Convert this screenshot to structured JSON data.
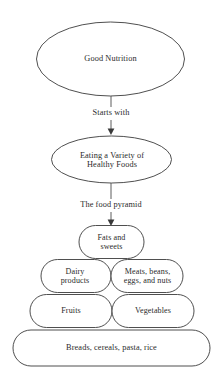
{
  "diagram": {
    "type": "flowchart",
    "title_node": "Good Nutrition",
    "nodes": [
      {
        "id": "good-nutrition",
        "shape": "ellipse",
        "label": "Good Nutrition"
      },
      {
        "id": "eating-variety",
        "shape": "ellipse",
        "label": "Eating a Variety of\nHealthy Foods"
      }
    ],
    "edges": [
      {
        "id": "edge-starts-with",
        "label": "Starts with",
        "from": "good-nutrition",
        "to": "eating-variety"
      },
      {
        "id": "edge-food-pyramid",
        "label": "The food pyramid",
        "from": "eating-variety",
        "to": "food-pyramid"
      }
    ],
    "pyramid": {
      "id": "food-pyramid",
      "tiers": [
        {
          "level": 1,
          "cells": [
            {
              "id": "fats-and-sweets",
              "label": "Fats and\nsweets"
            }
          ]
        },
        {
          "level": 2,
          "cells": [
            {
              "id": "dairy-products",
              "label": "Dairy\nproducts"
            },
            {
              "id": "meats-beans-eggs-nuts",
              "label": "Meats, beans,\neggs, and nuts"
            }
          ]
        },
        {
          "level": 3,
          "cells": [
            {
              "id": "fruits",
              "label": "Fruits"
            },
            {
              "id": "vegetables",
              "label": "Vegetables"
            }
          ]
        },
        {
          "level": 4,
          "cells": [
            {
              "id": "breads-cereals-pasta-rice",
              "label": "Breads, cereals, pasta, rice"
            }
          ]
        }
      ]
    },
    "colors": {
      "background": "#ffffff",
      "stroke": "#3b3b3b",
      "text": "#2b2b2b"
    }
  }
}
